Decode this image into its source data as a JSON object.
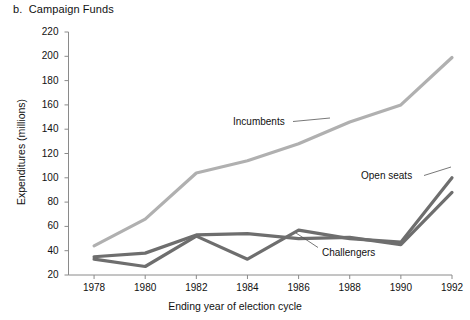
{
  "figure": {
    "title": "b.  Campaign Funds"
  },
  "chart_data": {
    "type": "line",
    "title": "b.  Campaign Funds",
    "xlabel": "Ending year of election cycle",
    "ylabel": "Expenditures (millions)",
    "x": [
      1978,
      1980,
      1982,
      1984,
      1986,
      1988,
      1990,
      1992
    ],
    "xtick_labels": [
      "1978",
      "1980",
      "1982",
      "1984",
      "1986",
      "1988",
      "1990",
      "1992"
    ],
    "xlim": [
      1977,
      1992
    ],
    "ylim": [
      20,
      220
    ],
    "yticks": [
      20,
      40,
      60,
      80,
      100,
      120,
      140,
      160,
      180,
      200,
      220
    ],
    "ytick_labels": [
      "20",
      "40",
      "60",
      "80",
      "100",
      "120",
      "140",
      "160",
      "180",
      "200",
      "220"
    ],
    "grid": false,
    "legend": "inline-annotations",
    "series": [
      {
        "name": "Incumbents",
        "color": "#b0b0b0",
        "values": [
          44,
          66,
          104,
          114,
          128,
          146,
          160,
          199
        ]
      },
      {
        "name": "Open seats",
        "color": "#6e6e6e",
        "values": [
          33,
          27,
          52,
          33,
          57,
          50,
          47,
          100
        ]
      },
      {
        "name": "Challengers",
        "color": "#6e6e6e",
        "values": [
          35,
          38,
          53,
          54,
          50,
          51,
          45,
          88
        ]
      }
    ],
    "annotations": [
      {
        "text": "Incumbents",
        "series": "Incumbents"
      },
      {
        "text": "Open seats",
        "series": "Open seats"
      },
      {
        "text": "Challengers",
        "series": "Challengers"
      }
    ]
  },
  "colors": {
    "incumbents": "#b0b0b0",
    "challengers": "#6e6e6e",
    "open_seats": "#6e6e6e",
    "axis": "#8a8a8a",
    "text": "#111111"
  }
}
